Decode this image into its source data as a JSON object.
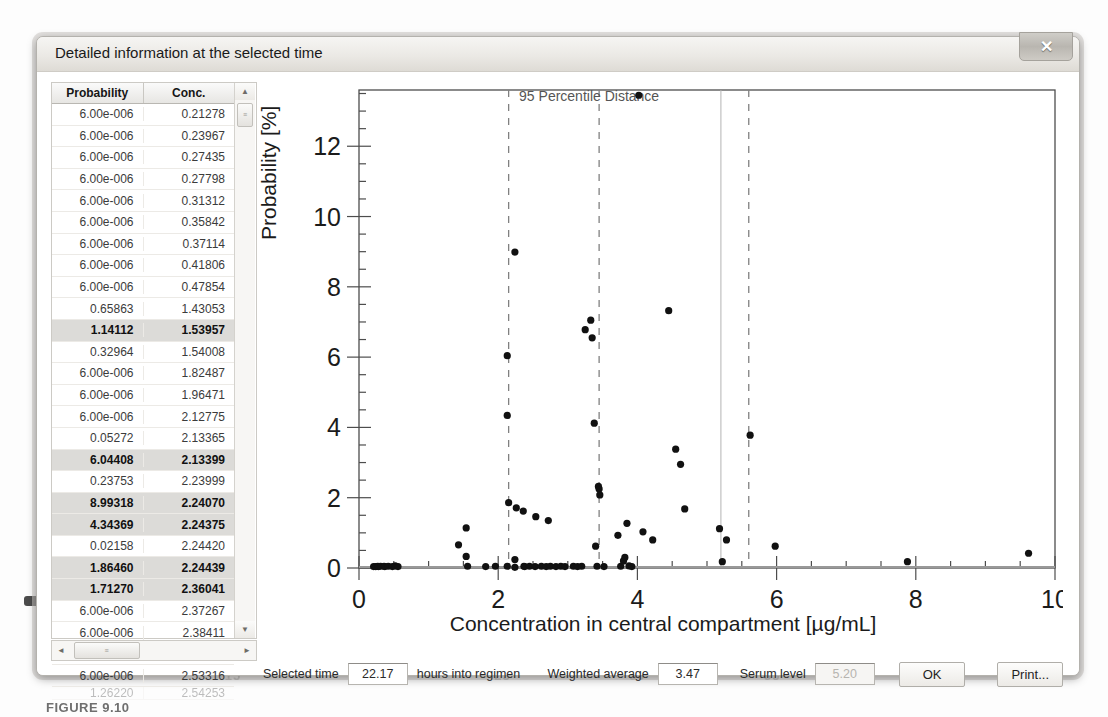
{
  "window": {
    "title": "Detailed information at the selected time",
    "close_label": "✕"
  },
  "table": {
    "headers": [
      "Probability",
      "Conc."
    ],
    "rows": [
      {
        "probability": "6.00e-006",
        "conc": "0.21278",
        "selected": false
      },
      {
        "probability": "6.00e-006",
        "conc": "0.23967",
        "selected": false
      },
      {
        "probability": "6.00e-006",
        "conc": "0.27435",
        "selected": false
      },
      {
        "probability": "6.00e-006",
        "conc": "0.27798",
        "selected": false
      },
      {
        "probability": "6.00e-006",
        "conc": "0.31312",
        "selected": false
      },
      {
        "probability": "6.00e-006",
        "conc": "0.35842",
        "selected": false
      },
      {
        "probability": "6.00e-006",
        "conc": "0.37114",
        "selected": false
      },
      {
        "probability": "6.00e-006",
        "conc": "0.41806",
        "selected": false
      },
      {
        "probability": "6.00e-006",
        "conc": "0.47854",
        "selected": false
      },
      {
        "probability": "0.65863",
        "conc": "1.43053",
        "selected": false
      },
      {
        "probability": "1.14112",
        "conc": "1.53957",
        "selected": true
      },
      {
        "probability": "0.32964",
        "conc": "1.54008",
        "selected": false
      },
      {
        "probability": "6.00e-006",
        "conc": "1.82487",
        "selected": false
      },
      {
        "probability": "6.00e-006",
        "conc": "1.96471",
        "selected": false
      },
      {
        "probability": "6.00e-006",
        "conc": "2.12775",
        "selected": false
      },
      {
        "probability": "0.05272",
        "conc": "2.13365",
        "selected": false
      },
      {
        "probability": "6.04408",
        "conc": "2.13399",
        "selected": true
      },
      {
        "probability": "0.23753",
        "conc": "2.23999",
        "selected": false
      },
      {
        "probability": "8.99318",
        "conc": "2.24070",
        "selected": true
      },
      {
        "probability": "4.34369",
        "conc": "2.24375",
        "selected": true
      },
      {
        "probability": "0.02158",
        "conc": "2.24420",
        "selected": false
      },
      {
        "probability": "1.86460",
        "conc": "2.24439",
        "selected": true
      },
      {
        "probability": "1.71270",
        "conc": "2.36041",
        "selected": true
      },
      {
        "probability": "6.00e-006",
        "conc": "2.37267",
        "selected": false
      },
      {
        "probability": "6.00e-006",
        "conc": "2.38411",
        "selected": false
      },
      {
        "probability": "6.00e-006",
        "conc": "2.45097",
        "selected": false
      },
      {
        "probability": "6.00e-006",
        "conc": "2.53316",
        "selected": false
      },
      {
        "probability": "1.26220",
        "conc": "2.54253",
        "selected": false
      }
    ],
    "scroll_up_icon": "▲",
    "scroll_down_icon": "▼",
    "scroll_left_icon": "◄",
    "scroll_right_icon": "►",
    "thumb_grip": "≡"
  },
  "bottom_bar": {
    "selected_time_label": "Selected time",
    "selected_time_value": "22.17",
    "hours_label": "hours into regimen",
    "weighted_average_label": "Weighted average",
    "weighted_average_value": "3.47",
    "serum_level_label": "Serum level",
    "serum_level_value": "5.20",
    "ok_label": "OK",
    "print_label": "Print..."
  },
  "chart_data": {
    "type": "scatter",
    "title": "",
    "xlabel": "Concentration in central compartment [µg/mL]",
    "ylabel": "Probability [%]",
    "xlim": [
      0,
      10
    ],
    "ylim": [
      0,
      13.6
    ],
    "xticks": [
      0,
      2,
      4,
      6,
      8,
      10
    ],
    "yticks": [
      0,
      2,
      4,
      6,
      8,
      10,
      12
    ],
    "xminor_step": 0.5,
    "yminor_step": 0.5,
    "grid": false,
    "legend": null,
    "annotations": [
      {
        "text": "95 Percentile Distance",
        "x": 2.3,
        "y": 13.3
      }
    ],
    "vlines": [
      {
        "x": 2.15,
        "style": "dashed",
        "color": "#808080"
      },
      {
        "x": 3.45,
        "style": "dashed",
        "color": "#808080"
      },
      {
        "x": 5.2,
        "style": "solid",
        "color": "#b3b3b3"
      },
      {
        "x": 5.6,
        "style": "dashed",
        "color": "#808080"
      }
    ],
    "points": [
      [
        0.21,
        0.04
      ],
      [
        0.24,
        0.04
      ],
      [
        0.27,
        0.05
      ],
      [
        0.28,
        0.04
      ],
      [
        0.31,
        0.05
      ],
      [
        0.36,
        0.05
      ],
      [
        0.37,
        0.04
      ],
      [
        0.42,
        0.05
      ],
      [
        0.48,
        0.04
      ],
      [
        0.52,
        0.06
      ],
      [
        0.56,
        0.04
      ],
      [
        1.43,
        0.66
      ],
      [
        1.54,
        1.14
      ],
      [
        1.54,
        0.33
      ],
      [
        1.56,
        0.05
      ],
      [
        1.82,
        0.04
      ],
      [
        1.96,
        0.05
      ],
      [
        2.13,
        6.04
      ],
      [
        2.13,
        0.05
      ],
      [
        2.13,
        4.34
      ],
      [
        2.15,
        1.86
      ],
      [
        2.24,
        8.99
      ],
      [
        2.24,
        0.24
      ],
      [
        2.24,
        0.02
      ],
      [
        2.26,
        1.71
      ],
      [
        2.36,
        1.62
      ],
      [
        2.37,
        0.05
      ],
      [
        2.38,
        0.04
      ],
      [
        2.45,
        0.05
      ],
      [
        2.53,
        0.04
      ],
      [
        2.54,
        1.46
      ],
      [
        2.62,
        0.05
      ],
      [
        2.69,
        0.04
      ],
      [
        2.72,
        1.35
      ],
      [
        2.75,
        0.05
      ],
      [
        2.83,
        0.04
      ],
      [
        2.9,
        0.05
      ],
      [
        2.96,
        0.04
      ],
      [
        3.08,
        0.05
      ],
      [
        3.14,
        0.04
      ],
      [
        3.2,
        0.05
      ],
      [
        3.25,
        6.78
      ],
      [
        3.33,
        7.05
      ],
      [
        3.35,
        6.55
      ],
      [
        3.38,
        4.12
      ],
      [
        3.4,
        0.62
      ],
      [
        3.42,
        0.05
      ],
      [
        3.45,
        2.25
      ],
      [
        3.44,
        2.32
      ],
      [
        3.46,
        2.08
      ],
      [
        3.52,
        0.04
      ],
      [
        3.72,
        0.93
      ],
      [
        3.76,
        0.05
      ],
      [
        3.8,
        0.2
      ],
      [
        3.82,
        0.3
      ],
      [
        3.85,
        1.27
      ],
      [
        3.88,
        0.06
      ],
      [
        3.92,
        0.04
      ],
      [
        4.02,
        13.45
      ],
      [
        4.08,
        1.03
      ],
      [
        4.22,
        0.8
      ],
      [
        4.45,
        7.32
      ],
      [
        4.55,
        3.38
      ],
      [
        4.62,
        2.95
      ],
      [
        4.68,
        1.68
      ],
      [
        5.18,
        1.12
      ],
      [
        5.22,
        0.18
      ],
      [
        5.28,
        0.8
      ],
      [
        5.62,
        3.78
      ],
      [
        5.98,
        0.62
      ],
      [
        7.88,
        0.18
      ],
      [
        9.62,
        0.42
      ]
    ]
  },
  "background": {
    "tick_labels": [
      "10",
      "15",
      "20",
      "25",
      "30",
      "35",
      "40",
      "45"
    ],
    "figure_caption": "FIGURE 9.10"
  }
}
